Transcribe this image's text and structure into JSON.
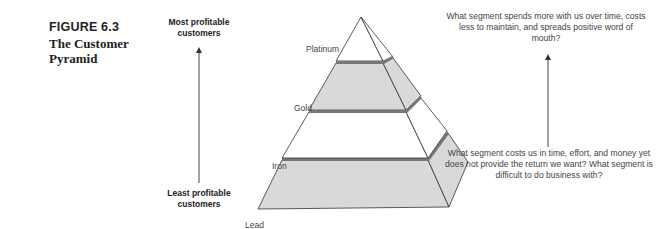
{
  "figure": {
    "label": "FIGURE 6.3",
    "title": "The Customer Pyramid"
  },
  "axis": {
    "top_label": "Most profitable customers",
    "bottom_label": "Least profitable customers",
    "direction": "up-arrow"
  },
  "pyramid": {
    "tiers": [
      {
        "label": "Platinum",
        "fill": "#ffffff"
      },
      {
        "label": "Gold",
        "fill": "#d9d9d9"
      },
      {
        "label": "Iron",
        "fill": "#ffffff"
      },
      {
        "label": "Lead",
        "fill": "#d9d9d9"
      }
    ],
    "band_color": "#777777",
    "edge_color": "#333333"
  },
  "questions": {
    "top": "What segment spends more with us over time, costs less to maintain, and spreads positive word of mouth?",
    "bottom": "What segment costs us in time, effort, and money yet does not provide the return we want? What segment is difficult to do business with?"
  }
}
